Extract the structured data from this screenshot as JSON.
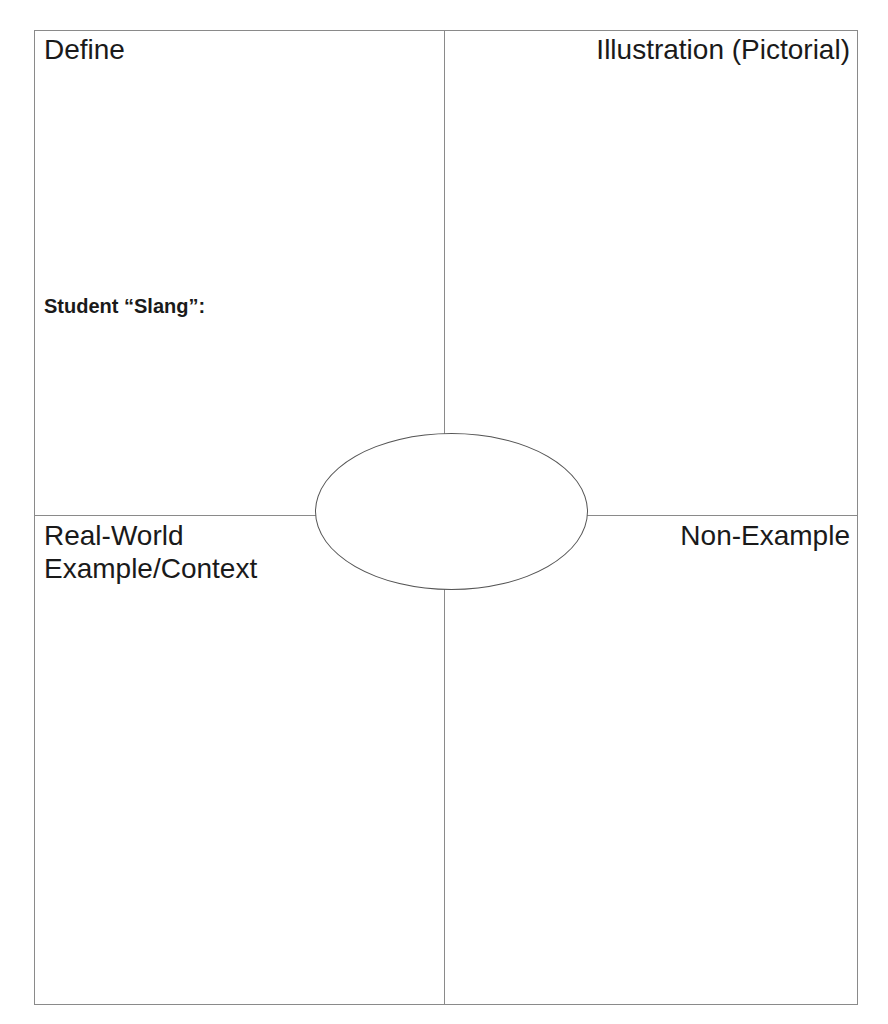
{
  "quadrants": {
    "top_left": "Define",
    "top_right": "Illustration (Pictorial)",
    "bottom_left_line1": "Real-World",
    "bottom_left_line2": "Example/Context",
    "bottom_right": "Non-Example"
  },
  "slang_label": "Student “Slang”:",
  "center": {
    "term": ""
  }
}
